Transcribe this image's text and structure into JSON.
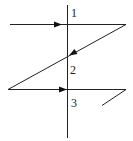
{
  "diagram": {
    "labels": {
      "l1": "1",
      "l2": "2",
      "l3": "3"
    },
    "colors": {
      "stroke": "#222222",
      "background": "#ffffff"
    }
  }
}
